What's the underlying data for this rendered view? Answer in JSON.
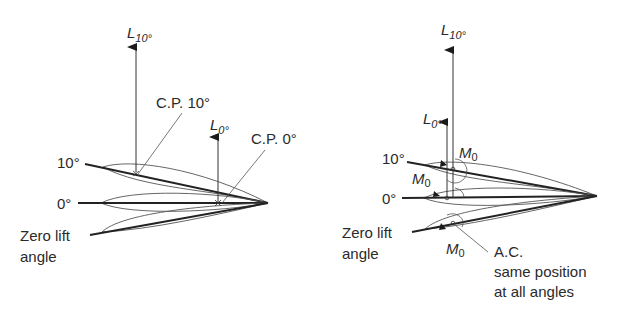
{
  "left_panel": {
    "title": "Centre of pressure movement",
    "lift_10": {
      "symbol": "L",
      "subscript": "10°"
    },
    "lift_0": {
      "symbol": "L",
      "subscript": "0°"
    },
    "cp_10_label": "C.P. 10°",
    "cp_0_label": "C.P. 0°",
    "angle_10_label": "10°",
    "angle_0_label": "0°",
    "zero_lift_label_line1": "Zero lift",
    "zero_lift_label_line2": "angle"
  },
  "right_panel": {
    "title": "Aerodynamic centre",
    "lift_10": {
      "symbol": "L",
      "subscript": "10°"
    },
    "lift_0": {
      "symbol": "L",
      "subscript": "0°"
    },
    "moment_label": {
      "symbol": "M",
      "subscript": "0"
    },
    "angle_10_label": "10°",
    "angle_0_label": "0°",
    "zero_lift_label_line1": "Zero lift",
    "zero_lift_label_line2": "angle",
    "ac_label_line1": "A.C.",
    "ac_label_line2": "same position",
    "ac_label_line3": "at all angles"
  },
  "colors": {
    "line": "#2a2a2a",
    "thin": "#555555",
    "background": "#ffffff"
  }
}
